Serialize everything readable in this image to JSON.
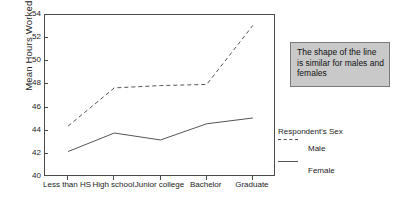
{
  "chart_data": {
    "type": "line",
    "title": "",
    "xlabel": "",
    "ylabel": "Mean Hours Worked Last Week",
    "categories": [
      "Less than HS",
      "High school",
      "Junior college",
      "Bachelor",
      "Graduate"
    ],
    "ylim": [
      40,
      54
    ],
    "yticks": [
      40,
      42,
      44,
      46,
      48,
      50,
      52,
      54
    ],
    "grid": false,
    "legend_position": "right",
    "legend_title": "Respondent's Sex",
    "series": [
      {
        "name": "Male",
        "style": "dashed",
        "values": [
          44.4,
          47.7,
          47.9,
          48.0,
          53.1
        ]
      },
      {
        "name": "Female",
        "style": "solid",
        "values": [
          42.2,
          43.8,
          43.2,
          44.6,
          45.1
        ]
      }
    ],
    "annotations": [
      {
        "text": "The shape of the line is similar for males and females"
      }
    ]
  },
  "colors": {
    "line": "#555555",
    "axis": "#4a4a4a",
    "annotation_bg": "#c9c9c9",
    "annotation_border": "#7b7b7b",
    "text": "#1c1c1c"
  }
}
